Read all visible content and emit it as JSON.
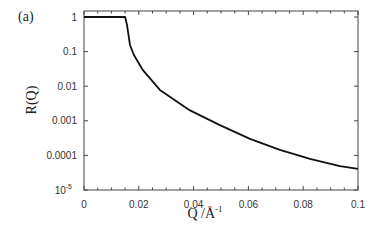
{
  "panel_label": "(a)",
  "chart_data": {
    "type": "line",
    "title": "",
    "xlabel": "Q /Å⁻¹",
    "xlabel_main": "Q /Å",
    "xlabel_sup": "-1",
    "ylabel": "R(Q)",
    "xlim": [
      0,
      0.1
    ],
    "ylim": [
      1e-05,
      1.4
    ],
    "yscale": "log",
    "grid": false,
    "legend": null,
    "x_ticks": [
      {
        "value": 0,
        "label": "0"
      },
      {
        "value": 0.02,
        "label": "0.02"
      },
      {
        "value": 0.04,
        "label": "0.04"
      },
      {
        "value": 0.06,
        "label": "0.06"
      },
      {
        "value": 0.08,
        "label": "0.08"
      },
      {
        "value": 0.1,
        "label": "0.1"
      }
    ],
    "y_ticks": [
      {
        "value": 1,
        "label": "1"
      },
      {
        "value": 0.1,
        "label": "0.1"
      },
      {
        "value": 0.01,
        "label": "0.01"
      },
      {
        "value": 0.001,
        "label": "0.001"
      },
      {
        "value": 0.0001,
        "label": "0.0001"
      },
      {
        "value": 1e-05,
        "label": "10",
        "sup": "-5"
      }
    ],
    "series": [
      {
        "name": "R(Q)",
        "color": "#111111",
        "x": [
          0,
          0.015,
          0.0157,
          0.0168,
          0.0182,
          0.0215,
          0.0277,
          0.0387,
          0.0496,
          0.0606,
          0.0715,
          0.0825,
          0.0934,
          0.1
        ],
        "y": [
          1,
          1,
          0.59,
          0.155,
          0.08,
          0.029,
          0.0078,
          0.002,
          0.00075,
          0.0003,
          0.000144,
          7.9e-05,
          4.9e-05,
          4.1e-05
        ]
      }
    ]
  }
}
